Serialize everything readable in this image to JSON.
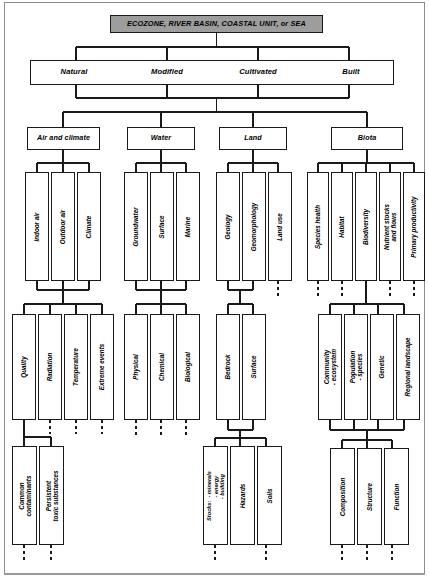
{
  "diagram": {
    "title": "ECOZONE, RIVER BASIN, COASTAL UNIT, or SEA",
    "title_color": "#9d9d9d",
    "line_color": "#1a1a1a",
    "tiers": [
      {
        "label": "Natural"
      },
      {
        "label": "Modified"
      },
      {
        "label": "Cultivated"
      },
      {
        "label": "Built"
      }
    ],
    "categories": [
      {
        "label": "Air and climate",
        "level3": [
          {
            "label": "Indoor air"
          },
          {
            "label": "Outdoor air"
          },
          {
            "label": "Climate"
          }
        ],
        "level4": [
          {
            "label": "Quality"
          },
          {
            "label": "Radiation"
          },
          {
            "label": "Temperature"
          },
          {
            "label": "Extreme events"
          }
        ],
        "level5": [
          {
            "label": "Common\ncontaminants"
          },
          {
            "label": "Persistent\ntoxic substances"
          }
        ]
      },
      {
        "label": "Water",
        "level3": [
          {
            "label": "Groundwater"
          },
          {
            "label": "Surface"
          },
          {
            "label": "Marine"
          }
        ],
        "level4": [
          {
            "label": "Physical"
          },
          {
            "label": "Chemical"
          },
          {
            "label": "Biological"
          }
        ],
        "level5": []
      },
      {
        "label": "Land",
        "level3": [
          {
            "label": "Geology"
          },
          {
            "label": "Geomorphology"
          },
          {
            "label": "Land use"
          }
        ],
        "level4": [
          {
            "label": "Bedrock"
          },
          {
            "label": "Surface"
          }
        ],
        "level5": [
          {
            "label": "Stocks:  - minerals\n            - energy\n            - building"
          },
          {
            "label": "Hazards"
          },
          {
            "label": "Soils"
          }
        ]
      },
      {
        "label": "Biota",
        "level3": [
          {
            "label": "Species health"
          },
          {
            "label": "Habitat"
          },
          {
            "label": "Biodiversity"
          },
          {
            "label": "Nutrient stocks\nand flows"
          },
          {
            "label": "Primary productivity"
          }
        ],
        "level4": [
          {
            "label": "Community\n- ecosystem"
          },
          {
            "label": "Population\n- species"
          },
          {
            "label": "Genetic"
          },
          {
            "label": "Regional landscape"
          }
        ],
        "level5": [
          {
            "label": "Composition"
          },
          {
            "label": "Structure"
          },
          {
            "label": "Function"
          }
        ]
      }
    ]
  }
}
